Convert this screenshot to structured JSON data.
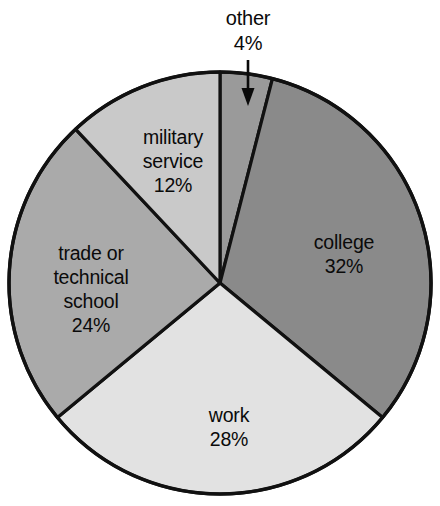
{
  "chart_data": {
    "type": "pie",
    "title": "",
    "subtitle": "",
    "xlabel": "",
    "ylabel": "",
    "categories": [
      "other",
      "college",
      "work",
      "trade or technical school",
      "military service"
    ],
    "values": [
      4,
      32,
      28,
      24,
      12
    ],
    "value_unit": "%",
    "value_labels": [
      "4%",
      "32%",
      "28%",
      "24%",
      "12%"
    ],
    "start_angle_deg": 0,
    "direction": "clockwise",
    "legend": "none",
    "grid": false,
    "slice_colors": [
      "#9a9a9a",
      "#8a8a8a",
      "#e2e2e2",
      "#aaaaaa",
      "#c9c9c9"
    ],
    "stroke_color": "#111111",
    "background": "#ffffff",
    "slices": [
      {
        "name": "other",
        "label": "other",
        "value": 4,
        "value_label": "4%",
        "color": "#9a9a9a",
        "label_placement": "callout-above",
        "label_x": 248,
        "label_y": 20,
        "value_x": 248,
        "value_y": 45
      },
      {
        "name": "college",
        "label": "college",
        "value": 32,
        "value_label": "32%",
        "color": "#8a8a8a",
        "label_placement": "inside",
        "label_x": 344,
        "label_y": 244,
        "value_x": 344,
        "value_y": 268
      },
      {
        "name": "work",
        "label": "work",
        "value": 28,
        "value_label": "28%",
        "color": "#e2e2e2",
        "label_placement": "inside",
        "label_x": 229,
        "label_y": 417,
        "value_x": 229,
        "value_y": 441
      },
      {
        "name": "trade or technical school",
        "label_line1": "trade or",
        "label_line2": "technical",
        "label_line3": "school",
        "value": 24,
        "value_label": "24%",
        "color": "#aaaaaa",
        "label_placement": "inside",
        "label_x": 91,
        "label_y": 255,
        "value_x": 91,
        "value_y": 327
      },
      {
        "name": "military service",
        "label_line1": "military",
        "label_line2": "service",
        "value": 12,
        "value_label": "12%",
        "color": "#c9c9c9",
        "label_placement": "inside",
        "label_x": 173,
        "label_y": 139,
        "value_x": 173,
        "value_y": 187
      }
    ],
    "annotations": [
      {
        "name": "other-arrow",
        "type": "arrow",
        "points_to": "other",
        "from_x": 248,
        "from_y": 60,
        "to_x": 248,
        "to_y": 102
      }
    ]
  },
  "geometry": {
    "center_x": 220,
    "center_y": 283,
    "radius": 211
  }
}
